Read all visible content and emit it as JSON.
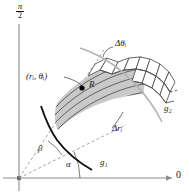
{
  "figure": {
    "axes": {
      "vertical_top_label_numerator": "π",
      "vertical_top_label_denominator": "2",
      "horizontal_end_label": "0",
      "axis_color": "#8c8c8c",
      "origin": {
        "x": 14,
        "y": 178
      }
    },
    "labels": {
      "sample_point": "(rᵢ, θᵢ)",
      "region": "R",
      "delta_theta": "Δθᵢ",
      "delta_r": "Δrᵢ",
      "inner_curve": "g₁",
      "outer_curve": "g₂",
      "angle_alpha": "α",
      "angle_beta": "β",
      "zero": "0"
    },
    "colors": {
      "region_fill": "#c9c9c9",
      "grid_line": "#4d4d4d",
      "boundary_dark": "#111111",
      "boundary_light": "#b3b3b3",
      "dashed_ray": "#9a9a9a",
      "axis": "#8c8c8c",
      "text": "#1a1a1a",
      "background": "#ffffff"
    },
    "geometry": {
      "alpha_deg": 26,
      "beta_deg": 56,
      "grid_radial_divisions": 7,
      "grid_angular_divisions": 7
    }
  }
}
